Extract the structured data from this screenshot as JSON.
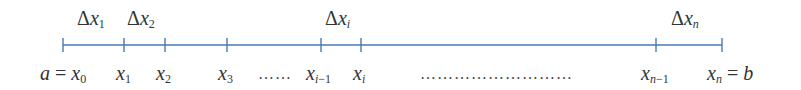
{
  "diagram": {
    "axis": {
      "y": 45,
      "x_start": 63,
      "x_end": 722,
      "color": "#4a78b5",
      "tick_top": 38,
      "tick_bottom": 52
    },
    "ticks": [
      63,
      124,
      165,
      227,
      321,
      361,
      656,
      722
    ],
    "points": [
      {
        "x": 63,
        "var": "x",
        "sub": "0",
        "prefix": "a = ",
        "suffix": ""
      },
      {
        "x": 124,
        "var": "x",
        "sub": "1",
        "prefix": "",
        "suffix": ""
      },
      {
        "x": 165,
        "var": "x",
        "sub": "2",
        "prefix": "",
        "suffix": ""
      },
      {
        "x": 227,
        "var": "x",
        "sub": "3",
        "prefix": "",
        "suffix": ""
      },
      {
        "x": 321,
        "var": "x",
        "sub": "i−1",
        "prefix": "",
        "suffix": ""
      },
      {
        "x": 361,
        "var": "x",
        "sub": "i",
        "prefix": "",
        "suffix": ""
      },
      {
        "x": 656,
        "var": "x",
        "sub": "n−1",
        "prefix": "",
        "suffix": ""
      },
      {
        "x": 722,
        "var": "x",
        "sub": "n",
        "prefix": "",
        "suffix": " = b"
      }
    ],
    "intervals": [
      {
        "label": "Δx",
        "sub": "1",
        "center": 98
      },
      {
        "label": "Δx",
        "sub": "2",
        "center": 146
      },
      {
        "label": "Δx",
        "sub": "i",
        "center": 342
      },
      {
        "label": "Δx",
        "sub": "n",
        "center": 690
      }
    ],
    "ellipses": [
      {
        "text": "……",
        "x": 258
      },
      {
        "text": "………………………",
        "x": 420
      }
    ]
  }
}
